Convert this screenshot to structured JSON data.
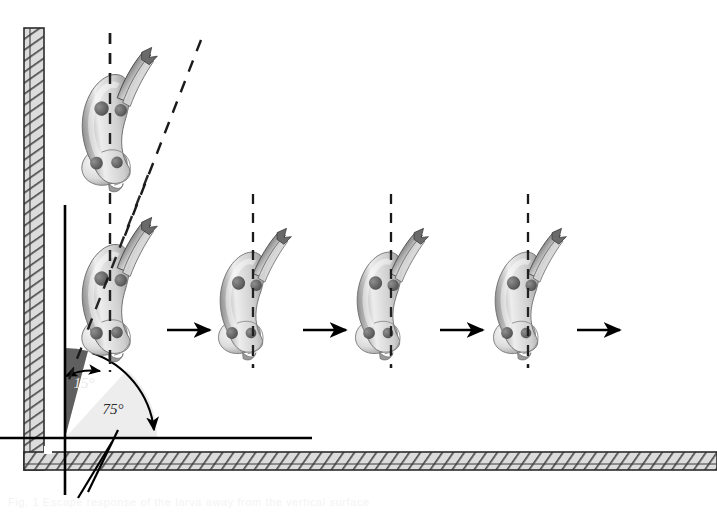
{
  "figure": {
    "name": "larva-escape-response-diagram",
    "background": "#ffffff",
    "width": 717,
    "height": 520
  },
  "annotations": {
    "angle_small": {
      "label": "15°",
      "value": 15,
      "unit": "degrees",
      "x": 84,
      "y": 388,
      "wedge_color": "#5f5f5f",
      "description": "angle between the vertical reference line and the tilted body axis"
    },
    "angle_large": {
      "label": "75°",
      "value": 75,
      "unit": "degrees",
      "x": 110,
      "y": 412,
      "wedge_color": "#e8e8e8",
      "description": "angle between the tilted body axis and the horizontal substrate line"
    }
  },
  "walls": {
    "vertical": {
      "name": "vertical-wall",
      "x": 24,
      "y_top": 28,
      "y_bottom": 470,
      "thickness": 20,
      "fill": "#d8d8d8",
      "hatch_color": "#4a4a4a"
    },
    "horizontal": {
      "name": "horizontal-wall",
      "x_left": 24,
      "x_right": 717,
      "y": 452,
      "thickness": 18,
      "fill": "#d8d8d8",
      "hatch_color": "#4a4a4a"
    }
  },
  "reference_lines": {
    "vertical_solid": {
      "x": 65,
      "y_top": 205,
      "y_bottom": 495,
      "color": "#000000"
    },
    "horizontal_solid": {
      "y": 438,
      "x_left": 0,
      "x_right": 312,
      "color": "#000000"
    },
    "dashed_vertical_primary": {
      "x": 110,
      "y_top": 33,
      "y_bottom": 372,
      "color": "#1a1a1a"
    },
    "dashed_body_axis": {
      "x1": 200,
      "y1": 40,
      "x2": 70,
      "y2": 380,
      "color": "#1a1a1a"
    }
  },
  "larvae": [
    {
      "name": "larva-1",
      "x": 72,
      "y": 58,
      "rotation": -16,
      "scale": 1.0,
      "dashed_axis": "vertical",
      "arrow": false
    },
    {
      "name": "larva-2",
      "x": 72,
      "y": 228,
      "rotation": -16,
      "scale": 1.0,
      "dashed_axis": "vertical-and-tilted",
      "arrow": true
    },
    {
      "name": "larva-3",
      "x": 212,
      "y": 236,
      "rotation": -14,
      "scale": 0.92,
      "dashed_axis": "vertical",
      "arrow": true
    },
    {
      "name": "larva-4",
      "x": 349,
      "y": 236,
      "rotation": -14,
      "scale": 0.92,
      "dashed_axis": "vertical",
      "arrow": true
    },
    {
      "name": "larva-5",
      "x": 487,
      "y": 236,
      "rotation": -14,
      "scale": 0.92,
      "dashed_axis": "vertical",
      "arrow": true
    }
  ],
  "motion_arrows": [
    {
      "name": "motion-arrow-1",
      "x1": 167,
      "x2": 216,
      "y": 330
    },
    {
      "name": "motion-arrow-2",
      "x1": 303,
      "x2": 352,
      "y": 330
    },
    {
      "name": "motion-arrow-3",
      "x1": 440,
      "x2": 489,
      "y": 330
    },
    {
      "name": "motion-arrow-4",
      "x1": 577,
      "x2": 626,
      "y": 330
    }
  ],
  "dashed_verticals": [
    {
      "name": "dashed-vertical-larva-3",
      "x": 253,
      "y_top": 194,
      "y_bottom": 368
    },
    {
      "name": "dashed-vertical-larva-4",
      "x": 391,
      "y_top": 194,
      "y_bottom": 368
    },
    {
      "name": "dashed-vertical-larva-5",
      "x": 528,
      "y_top": 194,
      "y_bottom": 368
    }
  ],
  "tick_marks": {
    "name": "corner-tick-marks",
    "strokes": [
      {
        "x1": 118,
        "y1": 430,
        "x2": 88,
        "y2": 492
      },
      {
        "x1": 112,
        "y1": 442,
        "x2": 78,
        "y2": 498
      }
    ]
  },
  "footer_artifact": {
    "name": "scan-artifact-text",
    "text": "Fig. 1  Escape response of the larva away from the vertical surface"
  }
}
